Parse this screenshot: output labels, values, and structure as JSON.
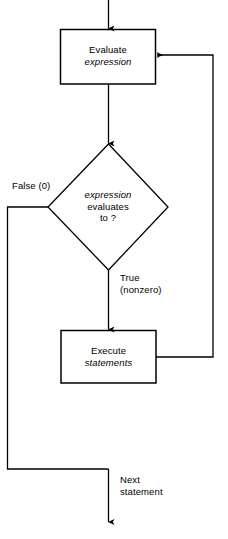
{
  "diagram": {
    "type": "flowchart",
    "width": 228,
    "height": 539,
    "stroke_color": "#000000",
    "background_color": "#ffffff",
    "nodes": {
      "evaluate_box": {
        "shape": "rectangle",
        "line1": "Evaluate",
        "line2": "expression",
        "line2_style": "italic"
      },
      "decision_diamond": {
        "shape": "diamond",
        "line1": "expression",
        "line1_style": "italic",
        "line2": "evaluates",
        "line3": "to ?"
      },
      "execute_box": {
        "shape": "rectangle",
        "line1": "Execute",
        "line2": "statements",
        "line2_style": "italic"
      }
    },
    "edge_labels": {
      "false_branch": "False (0)",
      "true_branch_line1": "True",
      "true_branch_line2": "(nonzero)",
      "exit_line1": "Next",
      "exit_line2": "statement"
    }
  }
}
